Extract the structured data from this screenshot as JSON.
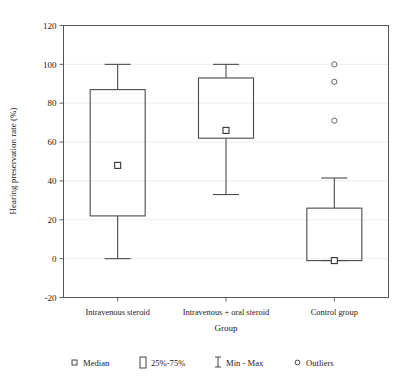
{
  "chart_data": {
    "type": "box",
    "title": "",
    "xlabel": "Group",
    "ylabel": "Hearing preservation rate (%)",
    "ylim": [
      -20,
      120
    ],
    "yticks": [
      -20,
      0,
      20,
      40,
      60,
      80,
      100,
      120
    ],
    "ytick_labels": [
      "-20",
      "0",
      "20",
      "40",
      "60",
      "80",
      "100",
      "120"
    ],
    "grid": true,
    "legend_position": "below-axes",
    "categories": [
      "Intravenous steroid",
      "Intravenous + oral steroid",
      "Control group"
    ],
    "boxes": [
      {
        "category": "Intravenous steroid",
        "min": 0,
        "q1": 22,
        "median": 48,
        "q3": 87,
        "max": 100,
        "outliers": []
      },
      {
        "category": "Intravenous + oral steroid",
        "min": 33,
        "q1": 62,
        "median": 66,
        "q3": 93,
        "max": 100,
        "outliers": []
      },
      {
        "category": "Control group",
        "min": -1,
        "q1": -1,
        "median": -1,
        "q3": 26,
        "max": 41.5,
        "outliers": [
          100,
          91,
          71
        ]
      }
    ],
    "legend": [
      {
        "label": "Median",
        "glyph": "small-square-marker"
      },
      {
        "label": "25%-75%",
        "glyph": "tall-rectangle-marker"
      },
      {
        "label": "Min - Max",
        "glyph": "i-beam-marker"
      },
      {
        "label": "Outliers",
        "glyph": "small-circle-marker"
      }
    ],
    "colors": {
      "box_stroke": "#4a4a4a",
      "axis": "#555555",
      "grid": "#e8e8e8",
      "text": "#1a1a1a",
      "background": "#ffffff"
    }
  }
}
